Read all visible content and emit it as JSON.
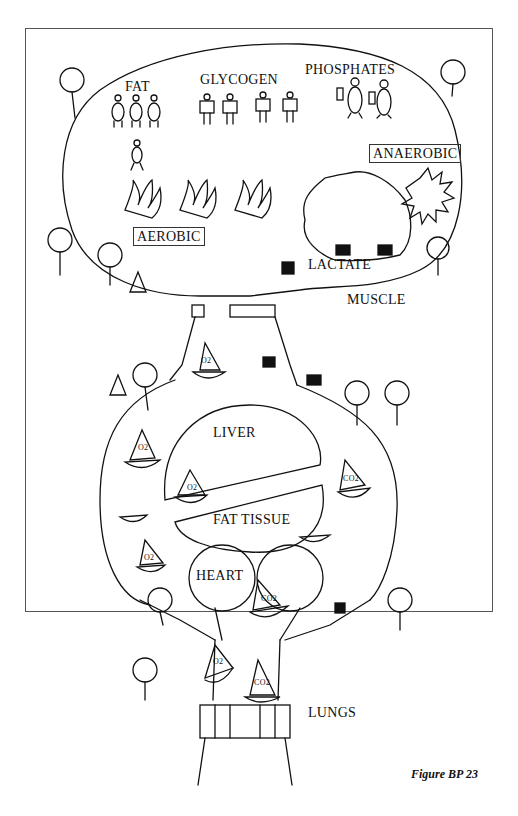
{
  "figure": {
    "caption": "Figure BP 23",
    "labels": {
      "fat": "FAT",
      "glycogen": "GLYCOGEN",
      "phosphates": "PHOSPHATES",
      "anaerobic": "ANAEROBIC",
      "aerobic": "AEROBIC",
      "lactate": "LACTATE",
      "muscle": "MUSCLE",
      "liver": "LIVER",
      "fat_tissue": "FAT TISSUE",
      "heart": "HEART",
      "lungs": "LUNGS"
    },
    "boat_labels": {
      "oxygen": "O2",
      "carbon_dioxide": "CO2"
    }
  }
}
